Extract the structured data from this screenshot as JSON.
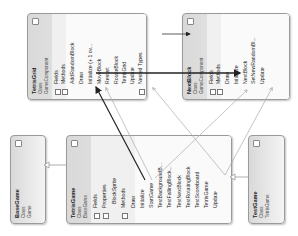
{
  "classes": {
    "tetris_grid": {
      "name": "TetrisGrid",
      "kind": "Class",
      "base": "GameComponent",
      "sections": {
        "fields": "Fields",
        "methods": "Methods",
        "nested": "Nested Types"
      },
      "methods": [
        "AddRandomBlock",
        "Draw",
        "Initialize (+ 1 ov...",
        "MoveBlock",
        "Restart",
        "RotateBlock",
        "TetrisGrid",
        "Update"
      ]
    },
    "next_block": {
      "name": "NextBlock",
      "kind": "Class",
      "base": "GameComponent",
      "sections": {
        "fields": "Fields",
        "methods": "Methods"
      },
      "methods": [
        "Draw",
        "Initialize",
        "NextBlock",
        "SetNewRandomBl...",
        "Update"
      ]
    },
    "base_game": {
      "name": "BaseGame",
      "kind": "Class",
      "base": "Game"
    },
    "tetris_game": {
      "name": "TetrisGame",
      "kind": "Class",
      "base": "BaseGame",
      "sections": {
        "fields": "Fields",
        "properties": "Properties",
        "methods": "Methods"
      },
      "properties": [
        "BlockSprite"
      ],
      "methods": [
        "Draw",
        "Initialize",
        "StartGame",
        "TestBackgroundB...",
        "TestFallingBlock...",
        "TestNextBlock",
        "TestRotatingBlock",
        "TestScoreboard",
        "TetrisGame",
        "Update"
      ]
    },
    "test_game": {
      "name": "TestGame",
      "kind": "Class",
      "base": "TetrisGame"
    }
  },
  "glyphs": {
    "collapse": "«",
    "expand": "+",
    "collapse_section": "−",
    "inherit_arrow": "▷"
  },
  "colors": {
    "box_border": "#9a9a9a",
    "method_bullet": "#3a6fb0",
    "strong_link": "#222222",
    "weak_link": "#9a9a9a"
  }
}
